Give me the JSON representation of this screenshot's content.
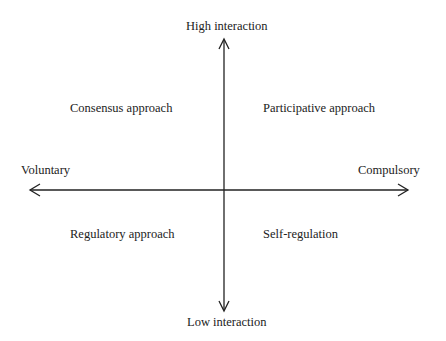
{
  "diagram": {
    "axes": {
      "vertical": {
        "top_label": "High interaction",
        "bottom_label": "Low interaction"
      },
      "horizontal": {
        "left_label": "Voluntary",
        "right_label": "Compulsory"
      }
    },
    "quadrants": {
      "top_left": "Consensus approach",
      "top_right": "Participative approach",
      "bottom_left": "Regulatory approach",
      "bottom_right": "Self-regulation"
    },
    "colors": {
      "line": "#222222",
      "text": "#222222",
      "background": "#ffffff"
    }
  }
}
